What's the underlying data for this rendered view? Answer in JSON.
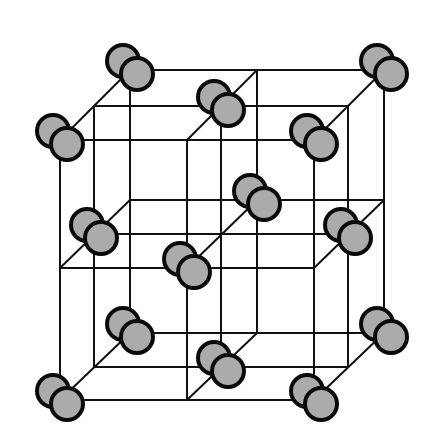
{
  "diagram": {
    "title": "Face-centered cubic lattice of diatomic molecules",
    "type": "crystal-lattice-wireframe",
    "colors": {
      "background": "#ffffff",
      "edge": "#111111",
      "atom_fill": "#ababab",
      "atom_stroke": "#0a0a0a"
    },
    "atom_radius": 16,
    "pair_offsets": {
      "rear": [
        -7,
        -9
      ],
      "front": [
        7,
        4
      ]
    },
    "grid": {
      "front_plane": {
        "x": [
          60,
          187,
          314
        ],
        "y": [
          140,
          268,
          400
        ]
      },
      "middle_plane": {
        "x": [
          94,
          221,
          348
        ],
        "y": [
          106,
          234,
          367
        ]
      },
      "back_plane": {
        "x": [
          130,
          257,
          384
        ],
        "y": [
          70,
          200,
          333
        ]
      }
    },
    "molecules": [
      {
        "name": "corner-back-top-left",
        "at": [
          130,
          70
        ]
      },
      {
        "name": "corner-back-top-right",
        "at": [
          384,
          70
        ]
      },
      {
        "name": "face-top-center",
        "at": [
          221,
          106
        ]
      },
      {
        "name": "corner-front-top-left",
        "at": [
          60,
          140
        ]
      },
      {
        "name": "corner-front-top-right",
        "at": [
          314,
          140
        ]
      },
      {
        "name": "face-back-center",
        "at": [
          257,
          200
        ]
      },
      {
        "name": "face-left-center",
        "at": [
          94,
          234
        ]
      },
      {
        "name": "face-right-center",
        "at": [
          348,
          234
        ]
      },
      {
        "name": "face-front-center",
        "at": [
          187,
          268
        ]
      },
      {
        "name": "corner-back-bottom-left",
        "at": [
          130,
          333
        ]
      },
      {
        "name": "corner-back-bottom-right",
        "at": [
          384,
          333
        ]
      },
      {
        "name": "face-bottom-center",
        "at": [
          221,
          367
        ]
      },
      {
        "name": "corner-front-bottom-left",
        "at": [
          60,
          400
        ]
      },
      {
        "name": "corner-front-bottom-right",
        "at": [
          314,
          400
        ]
      }
    ]
  }
}
